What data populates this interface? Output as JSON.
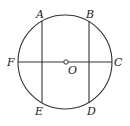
{
  "diagram": {
    "type": "circle-geometry",
    "circle": {
      "cx": 65,
      "cy": 62,
      "r": 47
    },
    "center": {
      "label": "O",
      "x": 66,
      "y": 62
    },
    "points": [
      {
        "label": "A",
        "x": 42,
        "y": 21
      },
      {
        "label": "B",
        "x": 89,
        "y": 21
      },
      {
        "label": "C",
        "x": 112,
        "y": 62
      },
      {
        "label": "D",
        "x": 89,
        "y": 103
      },
      {
        "label": "E",
        "x": 42,
        "y": 103
      },
      {
        "label": "F",
        "x": 18,
        "y": 62
      }
    ],
    "segments": [
      "AE",
      "BD",
      "FC"
    ],
    "labels": {
      "A": "A",
      "B": "B",
      "C": "C",
      "D": "D",
      "E": "E",
      "F": "F",
      "O": "O"
    }
  }
}
